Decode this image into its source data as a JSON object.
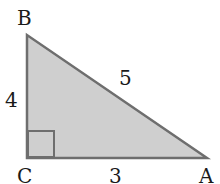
{
  "diagram": {
    "type": "right-triangle",
    "vertices": {
      "A": {
        "label": "A",
        "x": 207,
        "y": 158
      },
      "B": {
        "label": "B",
        "x": 27,
        "y": 35
      },
      "C": {
        "label": "C",
        "x": 27,
        "y": 158
      }
    },
    "sides": {
      "AB": {
        "label": "5"
      },
      "BC": {
        "label": "4"
      },
      "CA": {
        "label": "3"
      }
    },
    "right_angle_at": "C",
    "colors": {
      "fill": "#cfcfcf",
      "stroke": "#6e6e6e",
      "text": "#1a1a1a"
    }
  }
}
